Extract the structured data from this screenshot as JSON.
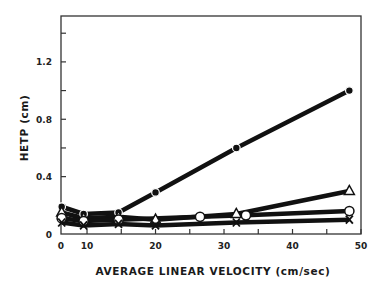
{
  "chart_data": {
    "type": "line",
    "title": "",
    "xlabel": "AVERAGE LINEAR VELOCITY (cm/sec)",
    "ylabel": "HETP (cm)",
    "xlim": [
      6.2,
      50
    ],
    "ylim": [
      0,
      1.52
    ],
    "x_ticks": [
      {
        "value": 6.2,
        "label": "0"
      },
      {
        "value": 10,
        "label": "10"
      },
      {
        "value": 15,
        "label": ""
      },
      {
        "value": 20,
        "label": "20"
      },
      {
        "value": 25,
        "label": ""
      },
      {
        "value": 30,
        "label": "30"
      },
      {
        "value": 35,
        "label": ""
      },
      {
        "value": 40,
        "label": "40"
      },
      {
        "value": 45,
        "label": ""
      },
      {
        "value": 50,
        "label": "50"
      }
    ],
    "y_ticks": [
      {
        "value": 0,
        "label": "0"
      },
      {
        "value": 0.2,
        "label": ""
      },
      {
        "value": 0.4,
        "label": "0.4"
      },
      {
        "value": 0.6,
        "label": ""
      },
      {
        "value": 0.8,
        "label": "0.8"
      },
      {
        "value": 1.0,
        "label": ""
      },
      {
        "value": 1.2,
        "label": "1.2"
      },
      {
        "value": 1.4,
        "label": ""
      }
    ],
    "grid": false,
    "legend": "none",
    "series": [
      {
        "name": "filled-circle",
        "marker": "filled-circle",
        "x": [
          6.3,
          9.5,
          14.6,
          20,
          31.8,
          48.3
        ],
        "y": [
          0.19,
          0.14,
          0.15,
          0.29,
          0.6,
          1.0
        ]
      },
      {
        "name": "open-triangle",
        "marker": "open-triangle",
        "x": [
          6.3,
          9.5,
          14.6,
          20,
          31.8,
          48.3
        ],
        "y": [
          0.15,
          0.11,
          0.12,
          0.1,
          0.14,
          0.3
        ]
      },
      {
        "name": "open-circle",
        "marker": "open-circle",
        "x": [
          6.3,
          9.5,
          14.6,
          26.5,
          33.2,
          48.3
        ],
        "y": [
          0.11,
          0.09,
          0.1,
          0.12,
          0.13,
          0.16
        ]
      },
      {
        "name": "x-mark",
        "marker": "x",
        "x": [
          6.3,
          9.5,
          14.6,
          20,
          31.8,
          48.3
        ],
        "y": [
          0.08,
          0.06,
          0.07,
          0.06,
          0.08,
          0.1
        ]
      }
    ]
  },
  "frame": {
    "left": 61,
    "top": 16,
    "right": 361,
    "bottom": 234
  }
}
